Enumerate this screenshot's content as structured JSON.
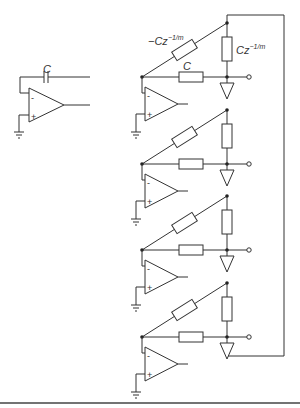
{
  "diagram": {
    "type": "circuit-schematic",
    "left_circuit": {
      "description": "Integrator op-amp with feedback capacitor",
      "capacitor_label": "C",
      "opamp_inputs": [
        "-",
        "+"
      ]
    },
    "right_circuit": {
      "description": "Cascade of 4 op-amp stages with fractional delay elements and buffers, feedback loop from bottom to top",
      "labels": {
        "diagonal_element": "−Cz",
        "diagonal_exponent": "−1/m",
        "vertical_element": "Cz",
        "vertical_exponent": "−1/m",
        "horizontal_element": "C"
      },
      "stages": 4,
      "opamp_inputs": [
        "-",
        "+"
      ]
    }
  }
}
